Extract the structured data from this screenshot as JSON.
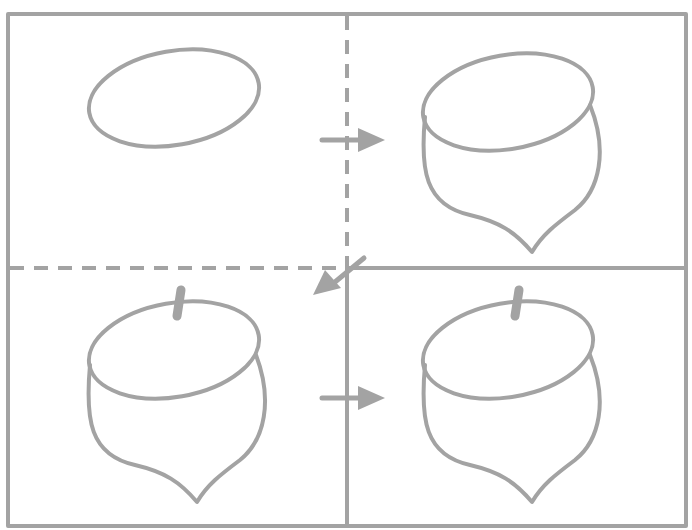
{
  "diagram": {
    "title": "",
    "stroke_color": "#a0a0a0",
    "background": "#ffffff",
    "steps": [
      {
        "index": 1,
        "content": "ellipse"
      },
      {
        "index": 2,
        "content": "ellipse with acorn body"
      },
      {
        "index": 3,
        "content": "acorn with stem"
      },
      {
        "index": 4,
        "content": "completed acorn"
      }
    ],
    "arrows": [
      "step1-to-step2",
      "step2-to-step3",
      "step3-to-step4"
    ]
  }
}
